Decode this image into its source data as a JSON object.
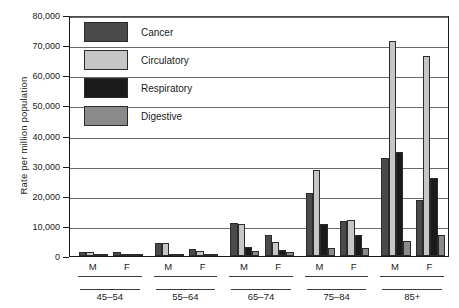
{
  "chart_data": {
    "type": "bar",
    "title": "",
    "subtitle": "",
    "xlabel": "",
    "ylabel": "Rate per million population",
    "ylim": [
      0,
      80000
    ],
    "yticks": [
      0,
      10000,
      20000,
      30000,
      40000,
      50000,
      60000,
      70000,
      80000
    ],
    "ytick_labels": [
      "0",
      "10,000",
      "20,000",
      "30,000",
      "40,000",
      "50,000",
      "60,000",
      "70,000",
      "80,000"
    ],
    "grid": true,
    "legend_position": "top-left",
    "groups": [
      "45–54",
      "55–64",
      "65–74",
      "75–84",
      "85+"
    ],
    "subgroups": [
      "M",
      "F"
    ],
    "categories": [
      "45–54 M",
      "45–54 F",
      "55–64 M",
      "55–64 F",
      "65–74 M",
      "65–74 F",
      "75–84 M",
      "75–84 F",
      "85+ M",
      "85+ F"
    ],
    "series": [
      {
        "name": "Cancer",
        "color": "#4a4a4a",
        "values": [
          1300,
          1200,
          4200,
          2400,
          10800,
          7000,
          21000,
          11500,
          32500,
          18500
        ]
      },
      {
        "name": "Circulatory",
        "color": "#c6c6c6",
        "values": [
          1200,
          600,
          4300,
          1500,
          10500,
          4700,
          28500,
          12000,
          71500,
          66500
        ]
      },
      {
        "name": "Respiratory",
        "color": "#1a1a1a",
        "values": [
          400,
          300,
          800,
          600,
          3000,
          2000,
          10500,
          7000,
          34500,
          26000
        ]
      },
      {
        "name": "Digestive",
        "color": "#8a8a8a",
        "values": [
          500,
          300,
          800,
          600,
          1500,
          1200,
          2500,
          2500,
          5000,
          7000
        ]
      }
    ]
  }
}
